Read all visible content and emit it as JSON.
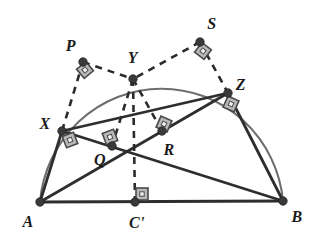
{
  "figure": {
    "kind": "geometry-diagram",
    "width": 319,
    "height": 244,
    "background": "#ffffff",
    "colors": {
      "solid_line": "#2e2e2e",
      "dashed_line": "#2b2b2b",
      "arc": "#6e6e6e",
      "vertex_dot": "#3a3a3a",
      "right_angle_fill": "#b9b9b9",
      "right_angle_stroke": "#4a4a4a",
      "label_text": "#1a1a1a"
    },
    "points": [
      {
        "id": "A",
        "label": "A",
        "x": 40,
        "y": 202,
        "label_x": 28,
        "label_y": 222,
        "dot": true
      },
      {
        "id": "B",
        "label": "B",
        "x": 283,
        "y": 201,
        "label_x": 297,
        "label_y": 217,
        "dot": true
      },
      {
        "id": "Cp",
        "label": "C'",
        "x": 135,
        "y": 202,
        "label_x": 137,
        "label_y": 223,
        "dot": true
      },
      {
        "id": "X",
        "label": "X",
        "x": 62,
        "y": 131,
        "label_x": 45,
        "label_y": 124,
        "dot": true
      },
      {
        "id": "Y",
        "label": "Y",
        "x": 133,
        "y": 79,
        "label_x": 133,
        "label_y": 58,
        "dot": true
      },
      {
        "id": "Z",
        "label": "Z",
        "x": 228,
        "y": 93,
        "label_x": 241,
        "label_y": 85,
        "dot": true
      },
      {
        "id": "Q",
        "label": "Q",
        "x": 112,
        "y": 146,
        "label_x": 100,
        "label_y": 160,
        "dot": true
      },
      {
        "id": "R",
        "label": "R",
        "x": 162,
        "y": 131,
        "label_x": 169,
        "label_y": 150,
        "dot": true
      },
      {
        "id": "P",
        "label": "P",
        "x": 83,
        "y": 62,
        "label_x": 71,
        "label_y": 46,
        "dot": true
      },
      {
        "id": "S",
        "label": "S",
        "x": 200,
        "y": 42,
        "label_x": 212,
        "label_y": 24,
        "dot": true
      }
    ],
    "solid_segments": [
      {
        "name": "segment-AB",
        "from": "A",
        "to": "B"
      },
      {
        "name": "segment-AX",
        "from": "A",
        "to": "X"
      },
      {
        "name": "segment-XZ",
        "from": "X",
        "to": "Z"
      },
      {
        "name": "segment-ZB",
        "from": "Z",
        "to": "B"
      },
      {
        "name": "segment-AZ",
        "from": "A",
        "to": "Z"
      },
      {
        "name": "segment-XB",
        "from": "X",
        "to": "B"
      }
    ],
    "dashed_segments": [
      {
        "name": "segment-PX",
        "from": "P",
        "to": "X"
      },
      {
        "name": "segment-PY",
        "from": "P",
        "to": "Y"
      },
      {
        "name": "segment-SY",
        "from": "S",
        "to": "Y"
      },
      {
        "name": "segment-SZ",
        "from": "S",
        "to": "Z"
      },
      {
        "name": "segment-YQ",
        "from": "Y",
        "to": "Q"
      },
      {
        "name": "segment-YR",
        "from": "Y",
        "to": "R"
      },
      {
        "name": "segment-YCp",
        "from": "Y",
        "to": "Cp"
      }
    ],
    "arc": {
      "name": "semicircle-arc",
      "from": "A",
      "to": "B",
      "radius_x": 122,
      "radius_y": 124,
      "passes_through": [
        "X",
        "Y",
        "Z"
      ]
    },
    "right_angle_marks": [
      {
        "name": "right-angle-at-X",
        "x": 70,
        "y": 140,
        "rotate": -21
      },
      {
        "name": "right-angle-at-Q",
        "x": 110,
        "y": 137,
        "rotate": -21
      },
      {
        "name": "right-angle-at-R",
        "x": 164,
        "y": 124,
        "rotate": 24
      },
      {
        "name": "right-angle-at-Z",
        "x": 231,
        "y": 104,
        "rotate": 24
      },
      {
        "name": "right-angle-at-Cp",
        "x": 142,
        "y": 194,
        "rotate": 0
      },
      {
        "name": "right-angle-at-P",
        "x": 85,
        "y": 70,
        "rotate": -40
      },
      {
        "name": "right-angle-at-S",
        "x": 203,
        "y": 51,
        "rotate": 38
      }
    ]
  }
}
